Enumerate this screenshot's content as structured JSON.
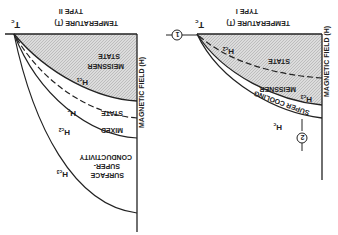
{
  "orientation": "rotated 180 degrees (upside down)",
  "left_panel": {
    "type_label": "TYPE II",
    "x_axis_label": "TEMPERATURE (T)",
    "tc_label": "T",
    "tc_sub": "c",
    "y_axis_label": "MAGNETIC FIELD (H)",
    "regions": {
      "meissner_line1": "MEISSNER",
      "meissner_line2": "STATE",
      "mixed_line1": "STATE",
      "mixed_line2": "MIXED",
      "surface_line1": "CONDUCTIVITY",
      "surface_line2": "SUPER-",
      "surface_line3": "SURFACE"
    },
    "curves": {
      "hc1": "H",
      "hc1_sub": "c1",
      "hc": "H",
      "hc_sub": "c",
      "hc2": "H",
      "hc2_sub": "c2",
      "hc3": "H",
      "hc3_sub": "c3"
    }
  },
  "right_panel": {
    "type_label": "TYPE I",
    "x_axis_label": "TEMPERATURE (T)",
    "tc_label": "T",
    "tc_sub": "c",
    "y_axis_label": "MAGNETIC FIELD (H)",
    "regions": {
      "meissner_line1": "STATE",
      "meissner_line2": "MEISSNER",
      "supercooling": "SUPER COOLING"
    },
    "curves": {
      "hc2": "H",
      "hc2_sub": "c2",
      "hc3": "H",
      "hc3_sub": "c3",
      "hc": "H",
      "hc_sub": "c"
    },
    "markers": {
      "path1": "1",
      "path2": "2"
    }
  },
  "colors": {
    "ink": "#222222",
    "shade": "#d0d0d0",
    "background": "#ffffff"
  }
}
